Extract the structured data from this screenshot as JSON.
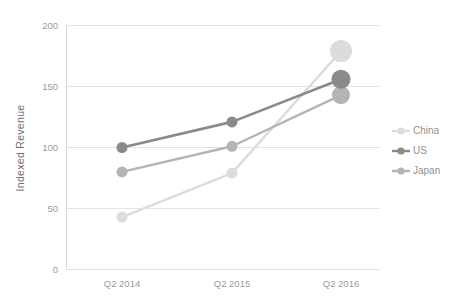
{
  "chart_data": {
    "type": "line",
    "title": "",
    "subtitle": "",
    "xlabel": "",
    "ylabel": "Indexed Revenue",
    "categories": [
      "Q2 2014",
      "Q2 2015",
      "Q2 2016"
    ],
    "ylim": [
      0,
      200
    ],
    "yticks": [
      0,
      50,
      100,
      150,
      200
    ],
    "ytick_labels": [
      "0",
      "50",
      "100",
      "150",
      "200"
    ],
    "grid": true,
    "legend_position": "right",
    "series": [
      {
        "name": "China",
        "color": "#dcdcdc",
        "values": [
          43,
          79,
          179
        ],
        "marker_sizes": [
          5.5,
          5.5,
          11
        ]
      },
      {
        "name": "US",
        "color": "#8a8a8a",
        "values": [
          100,
          121,
          156
        ],
        "marker_sizes": [
          5.5,
          5.5,
          9.5
        ]
      },
      {
        "name": "Japan",
        "color": "#b4b4b4",
        "values": [
          80,
          101,
          143
        ],
        "marker_sizes": [
          5.5,
          5.5,
          9
        ]
      }
    ]
  },
  "legend": {
    "items": [
      {
        "label": "China",
        "color": "#dcdcdc"
      },
      {
        "label": "US",
        "color": "#8a8a8a"
      },
      {
        "label": "Japan",
        "color": "#b4b4b4"
      }
    ]
  },
  "axes": {
    "y_title": "Indexed Revenue",
    "y_tick_labels": [
      "200",
      "150",
      "100",
      "50",
      "0"
    ],
    "x_tick_labels": [
      "Q2 2014",
      "Q2 2015",
      "Q2 2016"
    ]
  },
  "colors": {
    "grid": "#e3e3e3",
    "axis": "#d8d8d8",
    "text": "#9a9a9a",
    "background": "#ffffff"
  }
}
